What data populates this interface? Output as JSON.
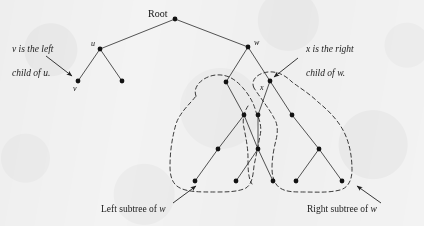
{
  "figure": {
    "kind": "binary-tree-diagram",
    "background_color": "#f3f3f3",
    "ink_color": "#2a2a2a",
    "width": 424,
    "height": 226
  },
  "labels": {
    "root": "Root",
    "u": "u",
    "v": "v",
    "w": "w",
    "x": "x"
  },
  "annotations": {
    "left_note_line1": "v is the left",
    "left_note_line2": "child of u.",
    "right_note_line1": "x is the right",
    "right_note_line2": "child of w.",
    "left_subtree_caption_a": "Left subtree of ",
    "left_subtree_caption_b": "w",
    "right_subtree_caption_a": "Right subtree of ",
    "right_subtree_caption_b": "w"
  },
  "tree": {
    "nodes": [
      {
        "id": "root",
        "x": 175,
        "y": 19
      },
      {
        "id": "u",
        "x": 100,
        "y": 49
      },
      {
        "id": "v",
        "x": 78,
        "y": 81
      },
      {
        "id": "u2",
        "x": 122,
        "y": 81
      },
      {
        "id": "w",
        "x": 248,
        "y": 47
      },
      {
        "id": "wl",
        "x": 226,
        "y": 82
      },
      {
        "id": "x",
        "x": 270,
        "y": 81
      },
      {
        "id": "n1",
        "x": 244,
        "y": 115
      },
      {
        "id": "n2",
        "x": 258,
        "y": 115
      },
      {
        "id": "n3",
        "x": 292,
        "y": 115
      },
      {
        "id": "n4",
        "x": 218,
        "y": 149
      },
      {
        "id": "n5",
        "x": 258,
        "y": 149
      },
      {
        "id": "n6",
        "x": 319,
        "y": 149
      },
      {
        "id": "n7",
        "x": 195,
        "y": 181
      },
      {
        "id": "n8",
        "x": 236,
        "y": 181
      },
      {
        "id": "n9",
        "x": 273,
        "y": 181
      },
      {
        "id": "n10",
        "x": 296,
        "y": 181
      },
      {
        "id": "n11",
        "x": 342,
        "y": 181
      }
    ],
    "edges": [
      [
        "root",
        "u"
      ],
      [
        "root",
        "w"
      ],
      [
        "u",
        "v"
      ],
      [
        "u",
        "u2"
      ],
      [
        "w",
        "wl"
      ],
      [
        "w",
        "x"
      ],
      [
        "wl",
        "n1"
      ],
      [
        "x",
        "n2"
      ],
      [
        "x",
        "n3"
      ],
      [
        "n1",
        "n4"
      ],
      [
        "n1",
        "n5"
      ],
      [
        "n2",
        "n5"
      ],
      [
        "n3",
        "n6"
      ],
      [
        "n4",
        "n7"
      ],
      [
        "n5",
        "n8"
      ],
      [
        "n5",
        "n9"
      ],
      [
        "n6",
        "n10"
      ],
      [
        "n6",
        "n11"
      ]
    ],
    "node_radius": 2.4,
    "edge_width": 0.8
  },
  "arrows": {
    "left_note_arrow": {
      "x1": 46,
      "y1": 56,
      "x2": 72,
      "y2": 76
    },
    "right_note_arrow": {
      "x1": 298,
      "y1": 58,
      "x2": 274,
      "y2": 77
    },
    "left_caption_arrow": {
      "x1": 173,
      "y1": 203,
      "x2": 196,
      "y2": 186
    },
    "right_caption_arrow": {
      "x1": 381,
      "y1": 203,
      "x2": 357,
      "y2": 186
    }
  },
  "contours": {
    "left_subtree_outline": "M 196 96 C 192 86, 204 76, 216 75 C 228 74, 236 80, 243 88 C 250 96, 254 104, 256 112 C 260 120, 262 128, 260 136 C 258 146, 256 156, 254 166 C 253 176, 252 184, 246 188 C 238 192, 226 192, 214 192 C 200 192, 188 192, 180 188 C 172 184, 170 176, 170 166 C 170 152, 172 138, 176 124 C 180 112, 190 104, 196 96 Z",
    "right_subtree_outline": "M 254 88 C 250 80, 258 73, 268 72 C 278 71, 286 76, 292 82 C 300 88, 310 94, 318 102 C 328 110, 338 120, 344 132 C 350 144, 352 158, 352 170 C 352 180, 348 188, 340 190 C 328 193, 316 192, 304 192 C 294 192, 286 192, 280 188 C 274 184, 272 176, 272 168 C 272 158, 274 148, 276 140 C 278 132, 278 124, 274 118 C 270 110, 262 100, 254 88 Z",
    "inner_notch": "M 248 106 C 244 112, 242 120, 244 128 C 246 138, 248 148, 248 158 C 248 168, 248 178, 252 184",
    "dash_pattern": "4,3",
    "stroke_width": 1.0
  }
}
